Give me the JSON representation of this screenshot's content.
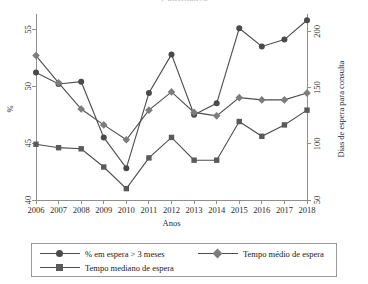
{
  "title_clipped": "y alternativa",
  "chart_data": {
    "type": "line",
    "title": "",
    "xlabel": "Anos",
    "ylabel": "%",
    "y2label": "Dias de espera para consulta",
    "x": [
      2006,
      2007,
      2008,
      2009,
      2010,
      2011,
      2012,
      2013,
      2014,
      2015,
      2016,
      2017,
      2018
    ],
    "categories": [
      "2006",
      "2007",
      "2008",
      "2009",
      "2010",
      "2011",
      "2012",
      "2013",
      "2014",
      "2015",
      "2016",
      "2017",
      "2018"
    ],
    "ylim": [
      40,
      56
    ],
    "yticks": [
      40,
      45,
      50,
      55
    ],
    "y2lim": [
      50,
      212
    ],
    "y2ticks": [
      50,
      100,
      150,
      200
    ],
    "grid": false,
    "legend_position": "bottom",
    "series": [
      {
        "name": "% em espera > 3 meses",
        "axis": "left",
        "marker": "circle",
        "color": "#4a4a4a",
        "values": [
          51.2,
          50.2,
          50.4,
          45.5,
          42.8,
          49.4,
          52.8,
          47.5,
          48.5,
          55.1,
          53.5,
          54.1,
          55.8
        ]
      },
      {
        "name": "Tempo médio de espera",
        "axis": "left",
        "marker": "diamond",
        "color": "#7d7d7d",
        "values": [
          52.7,
          50.3,
          48.0,
          46.6,
          45.3,
          47.9,
          49.5,
          47.7,
          47.4,
          49.0,
          48.8,
          48.8,
          49.4
        ]
      },
      {
        "name": "Tempo mediano de espera",
        "axis": "left",
        "marker": "square",
        "color": "#5a5a5a",
        "values": [
          44.9,
          44.6,
          44.5,
          42.9,
          41.0,
          43.7,
          45.5,
          43.5,
          43.5,
          46.9,
          45.6,
          46.6,
          47.9
        ]
      }
    ],
    "series_right_values": [
      {
        "name": "Tempo médio de espera",
        "values": [
          141,
          126,
          116,
          110,
          104,
          116,
          123,
          115,
          114,
          131,
          130,
          130,
          133
        ]
      },
      {
        "name": "Tempo mediano de espera",
        "values": [
          106,
          105,
          104,
          97,
          89,
          100,
          108,
          99,
          99,
          115,
          109,
          114,
          120
        ]
      }
    ]
  },
  "legend": {
    "items": [
      {
        "label": "% em espera > 3 meses",
        "marker": "circle"
      },
      {
        "label": "Tempo médio de espera",
        "marker": "diamond"
      },
      {
        "label": "Tempo mediano de espera",
        "marker": "square"
      }
    ]
  }
}
